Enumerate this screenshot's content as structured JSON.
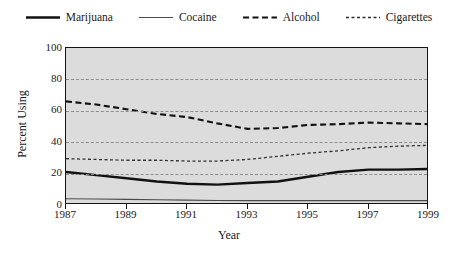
{
  "chart_data": {
    "type": "line",
    "title": "",
    "xlabel": "Year",
    "ylabel": "Percent Using",
    "x": [
      1987,
      1988,
      1989,
      1990,
      1991,
      1992,
      1993,
      1994,
      1995,
      1996,
      1997,
      1998,
      1999
    ],
    "xlim": [
      1987,
      1999
    ],
    "ylim": [
      0,
      100
    ],
    "xticks": [
      "1987",
      "1989",
      "1991",
      "1993",
      "1995",
      "1997",
      "1999"
    ],
    "xtick_values": [
      1987,
      1989,
      1991,
      1993,
      1995,
      1997,
      1999
    ],
    "yticks": [
      "0",
      "20",
      "40",
      "60",
      "80",
      "100"
    ],
    "ytick_values": [
      0,
      20,
      40,
      60,
      80,
      100
    ],
    "grid": "horizontal-dashed",
    "legend_position": "top-center",
    "plot_background": "#dcdcdc",
    "series": [
      {
        "name": "Marijuana",
        "style": "solid-thick",
        "color": "#111111",
        "width": 2.4,
        "dash": "none",
        "values": [
          21,
          19,
          17,
          15,
          13.5,
          13,
          14,
          15,
          18,
          21,
          22.5,
          22.5,
          23
        ]
      },
      {
        "name": "Cocaine",
        "style": "solid-thin",
        "color": "#4a4a4a",
        "width": 1.1,
        "dash": "none",
        "values": [
          4,
          3.8,
          3.6,
          3.3,
          3.1,
          2.9,
          2.8,
          2.8,
          2.8,
          2.8,
          2.8,
          2.8,
          2.8
        ]
      },
      {
        "name": "Alcohol",
        "style": "dashed-thick",
        "color": "#111111",
        "width": 2.1,
        "dash": "6,3.5",
        "values": [
          66,
          64,
          61,
          58,
          56,
          52,
          48.5,
          49,
          51,
          51.5,
          52.5,
          52,
          51.5
        ]
      },
      {
        "name": "Cigarettes",
        "style": "dashed-thin",
        "color": "#2e2e2e",
        "width": 1.3,
        "dash": "3,2.5",
        "values": [
          29.5,
          29,
          28.5,
          28.5,
          28,
          28,
          29,
          31,
          33,
          34.5,
          36.5,
          37.5,
          38
        ]
      }
    ]
  },
  "legend": {
    "items": [
      {
        "label": "Marijuana"
      },
      {
        "label": "Cocaine"
      },
      {
        "label": "Alcohol"
      },
      {
        "label": "Cigarettes"
      }
    ]
  }
}
